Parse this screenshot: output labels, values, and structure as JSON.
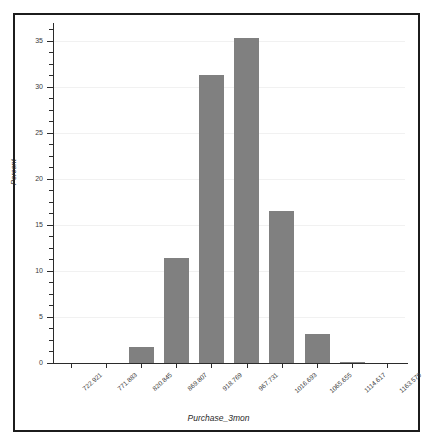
{
  "chart_data": {
    "type": "bar",
    "title": "",
    "subtitle": "",
    "xlabel": "Purchase_3mon",
    "ylabel": "Percent",
    "categories": [
      "722.921",
      "771.883",
      "820.845",
      "869.807",
      "918.769",
      "967.731",
      "1016.693",
      "1065.655",
      "1114.617",
      "1163.579"
    ],
    "values": [
      0,
      0,
      1.7,
      11.4,
      31.3,
      35.3,
      16.5,
      3.1,
      0.15,
      0
    ],
    "xlim": [
      698.44,
      1188.06
    ],
    "ylim": [
      0,
      36.5
    ],
    "yticks": [
      0,
      5,
      10,
      15,
      20,
      25,
      30,
      35
    ],
    "ytick_labels": [
      "0",
      "5",
      "10",
      "15",
      "20",
      "25",
      "30",
      "35"
    ],
    "y_minor_tick_step": 1.25,
    "grid": true,
    "grid_axis": "y",
    "legend": false,
    "bar_color": "#808080",
    "grid_color": "#f1f1f1",
    "axis_color": "#2b2b2b",
    "frame_color": "#1c1c1c",
    "background": "#ffffff",
    "xtick_rotation_deg": -42,
    "bar_width_fraction": 0.72
  },
  "figure": {
    "frame_border": true,
    "plot_left": 38,
    "plot_right": 390,
    "plot_top": 12,
    "plot_bottom": 348
  }
}
